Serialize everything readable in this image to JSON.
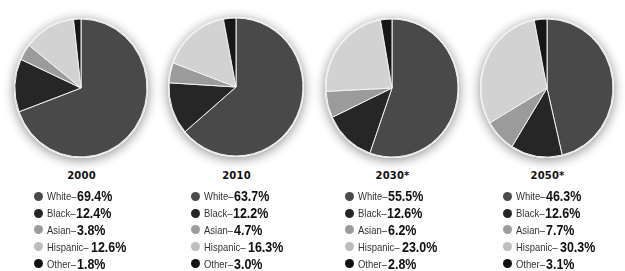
{
  "chart_data": [
    {
      "type": "pie",
      "title": "2000",
      "categories": [
        "White",
        "Black",
        "Asian",
        "Hispanic",
        "Other"
      ],
      "values": [
        69.4,
        12.4,
        3.8,
        12.6,
        1.8
      ],
      "unit": "%",
      "start_angle": "12 o'clock, clockwise",
      "legend_position": "bottom"
    },
    {
      "type": "pie",
      "title": "2010",
      "categories": [
        "White",
        "Black",
        "Asian",
        "Hispanic",
        "Other"
      ],
      "values": [
        63.7,
        12.2,
        4.7,
        16.3,
        3.0
      ],
      "unit": "%",
      "start_angle": "12 o'clock, clockwise",
      "legend_position": "bottom"
    },
    {
      "type": "pie",
      "title": "2030*",
      "categories": [
        "White",
        "Black",
        "Asian",
        "Hispanic",
        "Other"
      ],
      "values": [
        55.5,
        12.6,
        6.2,
        23.0,
        2.8
      ],
      "unit": "%",
      "start_angle": "12 o'clock, clockwise",
      "legend_position": "bottom"
    },
    {
      "type": "pie",
      "title": "2050*",
      "categories": [
        "White",
        "Black",
        "Asian",
        "Hispanic",
        "Other"
      ],
      "values": [
        46.3,
        12.6,
        7.7,
        30.3,
        3.1
      ],
      "unit": "%",
      "start_angle": "12 o'clock, clockwise",
      "legend_position": "bottom"
    }
  ],
  "colors": {
    "White": "#4a4a4a",
    "Black": "#262626",
    "Asian": "#9b9b9b",
    "Hispanic": "#d2d2d2",
    "Other": "#121212",
    "separator": "#f2f2f2"
  },
  "panels": [
    {
      "year": "2000",
      "items": [
        {
          "label": "White–",
          "value": "69.4%"
        },
        {
          "label": "Black–",
          "value": "12.4%"
        },
        {
          "label": "Asian–",
          "value": "3.8%"
        },
        {
          "label": "Hispanic–",
          "value": "12.6%"
        },
        {
          "label": "Other–",
          "value": "1.8%"
        }
      ]
    },
    {
      "year": "2010",
      "items": [
        {
          "label": "White–",
          "value": "63.7%"
        },
        {
          "label": "Black–",
          "value": "12.2%"
        },
        {
          "label": "Asian–",
          "value": "4.7%"
        },
        {
          "label": "Hispanic–",
          "value": "16.3%"
        },
        {
          "label": "Other–",
          "value": "3.0%"
        }
      ]
    },
    {
      "year": "2030*",
      "items": [
        {
          "label": "White–",
          "value": "55.5%"
        },
        {
          "label": "Black–",
          "value": "12.6%"
        },
        {
          "label": "Asian–",
          "value": "6.2%"
        },
        {
          "label": "Hispanic–",
          "value": "23.0%"
        },
        {
          "label": "Other–",
          "value": "2.8%"
        }
      ]
    },
    {
      "year": "2050*",
      "items": [
        {
          "label": "White–",
          "value": "46.3%"
        },
        {
          "label": "Black–",
          "value": "12.6%"
        },
        {
          "label": "Asian–",
          "value": "7.7%"
        },
        {
          "label": "Hispanic–",
          "value": "30.3%"
        },
        {
          "label": "Other–",
          "value": "3.1%"
        }
      ]
    }
  ]
}
